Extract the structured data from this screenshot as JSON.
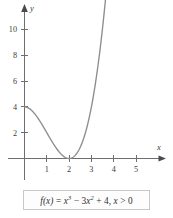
{
  "figure": {
    "name": "cubic-function-plot",
    "axes": {
      "x_label": "x",
      "y_label": "y",
      "x_ticks": [
        "1",
        "2",
        "3",
        "4",
        "5"
      ],
      "y_ticks": [
        "2",
        "4",
        "6",
        "8",
        "10"
      ]
    },
    "caption": {
      "lead": "f",
      "arg": "(x)",
      "eq": " = ",
      "x1": "x",
      "p1": "3",
      "minus": " − 3",
      "x2": "x",
      "p2": "2",
      "plus": " + 4, ",
      "x3": "x",
      "cond": " > 0",
      "full": "f(x) = x³ − 3x² + 4, x > 0"
    }
  },
  "chart_data": {
    "type": "line",
    "title": "",
    "subtitle": "",
    "xlabel": "x",
    "ylabel": "y",
    "xlim": [
      -0.35,
      6.3
    ],
    "ylim": [
      -1.6,
      12.6
    ],
    "xticks": [
      1,
      2,
      3,
      4,
      5
    ],
    "yticks": [
      2,
      4,
      6,
      8,
      10
    ],
    "grid": false,
    "legend": null,
    "annotations": [
      "f(x) = x^3 - 3x^2 + 4, x > 0"
    ],
    "series": [
      {
        "name": "f(x) = x^3 - 3x^2 + 4",
        "domain": [
          0,
          3.65
        ],
        "x": [
          0.0,
          0.2,
          0.4,
          0.6,
          0.8,
          1.0,
          1.2,
          1.4,
          1.6,
          1.8,
          2.0,
          2.2,
          2.4,
          2.6,
          2.8,
          3.0,
          3.2,
          3.4,
          3.65
        ],
        "y": [
          4.0,
          3.89,
          3.58,
          3.14,
          2.59,
          2.0,
          1.41,
          0.86,
          0.42,
          0.12,
          0.0,
          0.13,
          0.54,
          1.3,
          2.43,
          4.0,
          6.05,
          8.62,
          12.66
        ]
      }
    ]
  }
}
